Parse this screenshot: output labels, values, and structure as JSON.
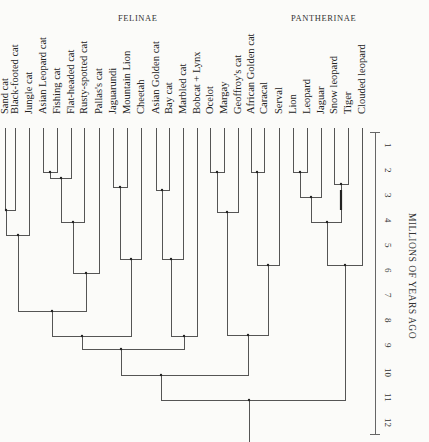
{
  "groups": [
    {
      "label": "FELINAE",
      "x": 118,
      "y": 13
    },
    {
      "label": "PANTHERINAE",
      "x": 291,
      "y": 13
    }
  ],
  "axis": {
    "title": "MILLIONS OF YEARS AGO",
    "ticks": [
      "1",
      "2",
      "3",
      "4",
      "5",
      "6",
      "7",
      "8",
      "9",
      "10",
      "11",
      "12"
    ],
    "x": 375,
    "y0": 122,
    "px_per_unit": 25,
    "range": [
      0.4,
      12.5
    ]
  },
  "leaves": [
    {
      "name": "Sand cat",
      "x": 5
    },
    {
      "name": "Black-footed cat",
      "x": 15
    },
    {
      "name": "Jungle cat",
      "x": 29
    },
    {
      "name": "Asian Leopard cat",
      "x": 43
    },
    {
      "name": "Fishing cat",
      "x": 57
    },
    {
      "name": "Flat-headed cat",
      "x": 71
    },
    {
      "name": "Rusty-spotted cat",
      "x": 84
    },
    {
      "name": "Pallas's cat",
      "x": 99
    },
    {
      "name": "Jaguarundi",
      "x": 113
    },
    {
      "name": "Mountain Lion",
      "x": 127
    },
    {
      "name": "Cheetah",
      "x": 141
    },
    {
      "name": "Asian Golden cat",
      "x": 156
    },
    {
      "name": "Bay cat",
      "x": 169
    },
    {
      "name": "Marbled cat",
      "x": 183
    },
    {
      "name": "Bobcat + Lynx",
      "x": 197
    },
    {
      "name": "Ocelot",
      "x": 210
    },
    {
      "name": "Margay",
      "x": 224
    },
    {
      "name": "Geoffroy's cat",
      "x": 238
    },
    {
      "name": "African Golden cat",
      "x": 251
    },
    {
      "name": "Caracal",
      "x": 264
    },
    {
      "name": "Serval",
      "x": 279
    },
    {
      "name": "Lion",
      "x": 293
    },
    {
      "name": "Leopard",
      "x": 307
    },
    {
      "name": "Jaguar",
      "x": 321
    },
    {
      "name": "Snow leopard",
      "x": 334
    },
    {
      "name": "Tiger",
      "x": 348
    },
    {
      "name": "Clouded leopard",
      "x": 362
    }
  ],
  "chart_data": {
    "type": "dendrogram",
    "title": "",
    "clades": [
      "FELINAE",
      "PANTHERINAE"
    ],
    "xlabel": "",
    "ylabel": "MILLIONS OF YEARS AGO",
    "ylim": [
      0,
      12.5
    ],
    "joins": [
      {
        "members": [
          "Sand cat",
          "Black-footed cat"
        ],
        "age": 3.5
      },
      {
        "members": [
          "Sand/Black-footed",
          "Jungle cat"
        ],
        "age": 4.5
      },
      {
        "members": [
          "Asian Leopard cat",
          "Fishing cat"
        ],
        "age": 2.0
      },
      {
        "members": [
          "Asian Leopard/Fishing",
          "Flat-headed cat"
        ],
        "age": 2.3
      },
      {
        "members": [
          "Leopard cat group",
          "Rusty-spotted cat"
        ],
        "age": 4.0
      },
      {
        "members": [
          "Leopard cat group",
          "Pallas's cat"
        ],
        "age": 6.0
      },
      {
        "members": [
          "Domestic lineage",
          "Leopard cat lineage"
        ],
        "age": 7.5
      },
      {
        "members": [
          "Jaguarundi",
          "Mountain Lion"
        ],
        "age": 2.6
      },
      {
        "members": [
          "Puma group",
          "Cheetah"
        ],
        "age": 5.5
      },
      {
        "members": [
          "Asian Golden cat",
          "Bay cat"
        ],
        "age": 2.7
      },
      {
        "members": [
          "Bay cat group",
          "Marbled cat"
        ],
        "age": 5.5
      },
      {
        "members": [
          "Bay cat group",
          "Bobcat + Lynx"
        ],
        "age": 8.5
      },
      {
        "members": [
          "Puma group",
          "Bay cat group"
        ],
        "age": 9.0
      },
      {
        "members": [
          "Ocelot",
          "Margay"
        ],
        "age": 3.0
      },
      {
        "members": [
          "Ocelot/Margay",
          "Geoffroy's cat"
        ],
        "age": 4.0
      },
      {
        "members": [
          "African Golden cat",
          "Caracal"
        ],
        "age": 2.6
      },
      {
        "members": [
          "Caracal group",
          "Serval"
        ],
        "age": 6.2
      },
      {
        "members": [
          "Lion",
          "Leopard"
        ],
        "age": 2.6
      },
      {
        "members": [
          "Lion/Leopard",
          "Jaguar"
        ],
        "age": 3.0
      },
      {
        "members": [
          "Snow leopard",
          "Tiger"
        ],
        "age": 3.2
      },
      {
        "members": [
          "Panthera",
          "Snow leopard/Tiger"
        ],
        "age": 4.0
      },
      {
        "members": [
          "Panthera",
          "Clouded leopard"
        ],
        "age": 6.2
      },
      {
        "members": [
          "Felinae",
          "Pantherinae"
        ],
        "age": 11.5
      }
    ]
  }
}
